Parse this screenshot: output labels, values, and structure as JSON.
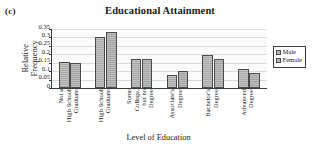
{
  "panel": {
    "letter": "(c)"
  },
  "chart_data": {
    "type": "bar",
    "title": "Educational Attainment",
    "xlabel": "Level of Education",
    "ylabel": "Relative Frequency",
    "ylim": [
      0,
      0.35
    ],
    "yticks": [
      0,
      0.05,
      0.1,
      0.15,
      0.2,
      0.25,
      0.3,
      0.35
    ],
    "ytick_labels": [
      "0",
      "0.05",
      "0.1",
      "0.15",
      "0.2",
      "0.25",
      "0.3",
      "0.35"
    ],
    "grid": "horizontal",
    "legend_position": "right",
    "categories": [
      "Not a High School Graduate",
      "High School Graduate",
      "Some College, but no Degree",
      "Associate's Degree",
      "Bachelor's Degree",
      "Advanced Degree"
    ],
    "category_lines": [
      [
        "Not a",
        "High School",
        "Graduate"
      ],
      [
        "High School",
        "Graduate"
      ],
      [
        "Some",
        "College,",
        "but no",
        "Degree"
      ],
      [
        "Associate's",
        "Degree"
      ],
      [
        "Bachelor's",
        "Degree"
      ],
      [
        "Advanced",
        "Degree"
      ]
    ],
    "series": [
      {
        "name": "Male",
        "values": [
          0.155,
          0.305,
          0.175,
          0.078,
          0.193,
          0.11
        ]
      },
      {
        "name": "Female",
        "values": [
          0.149,
          0.335,
          0.175,
          0.098,
          0.175,
          0.09
        ]
      }
    ],
    "colors": {
      "male": "#a9a9a9",
      "female": "#a3a3a3",
      "outline": "#4a4a4a",
      "axis": "#3a3a3a",
      "grid": "#dcdcdc"
    }
  },
  "legend": {
    "items": [
      {
        "label": "Male"
      },
      {
        "label": "Female"
      }
    ]
  }
}
